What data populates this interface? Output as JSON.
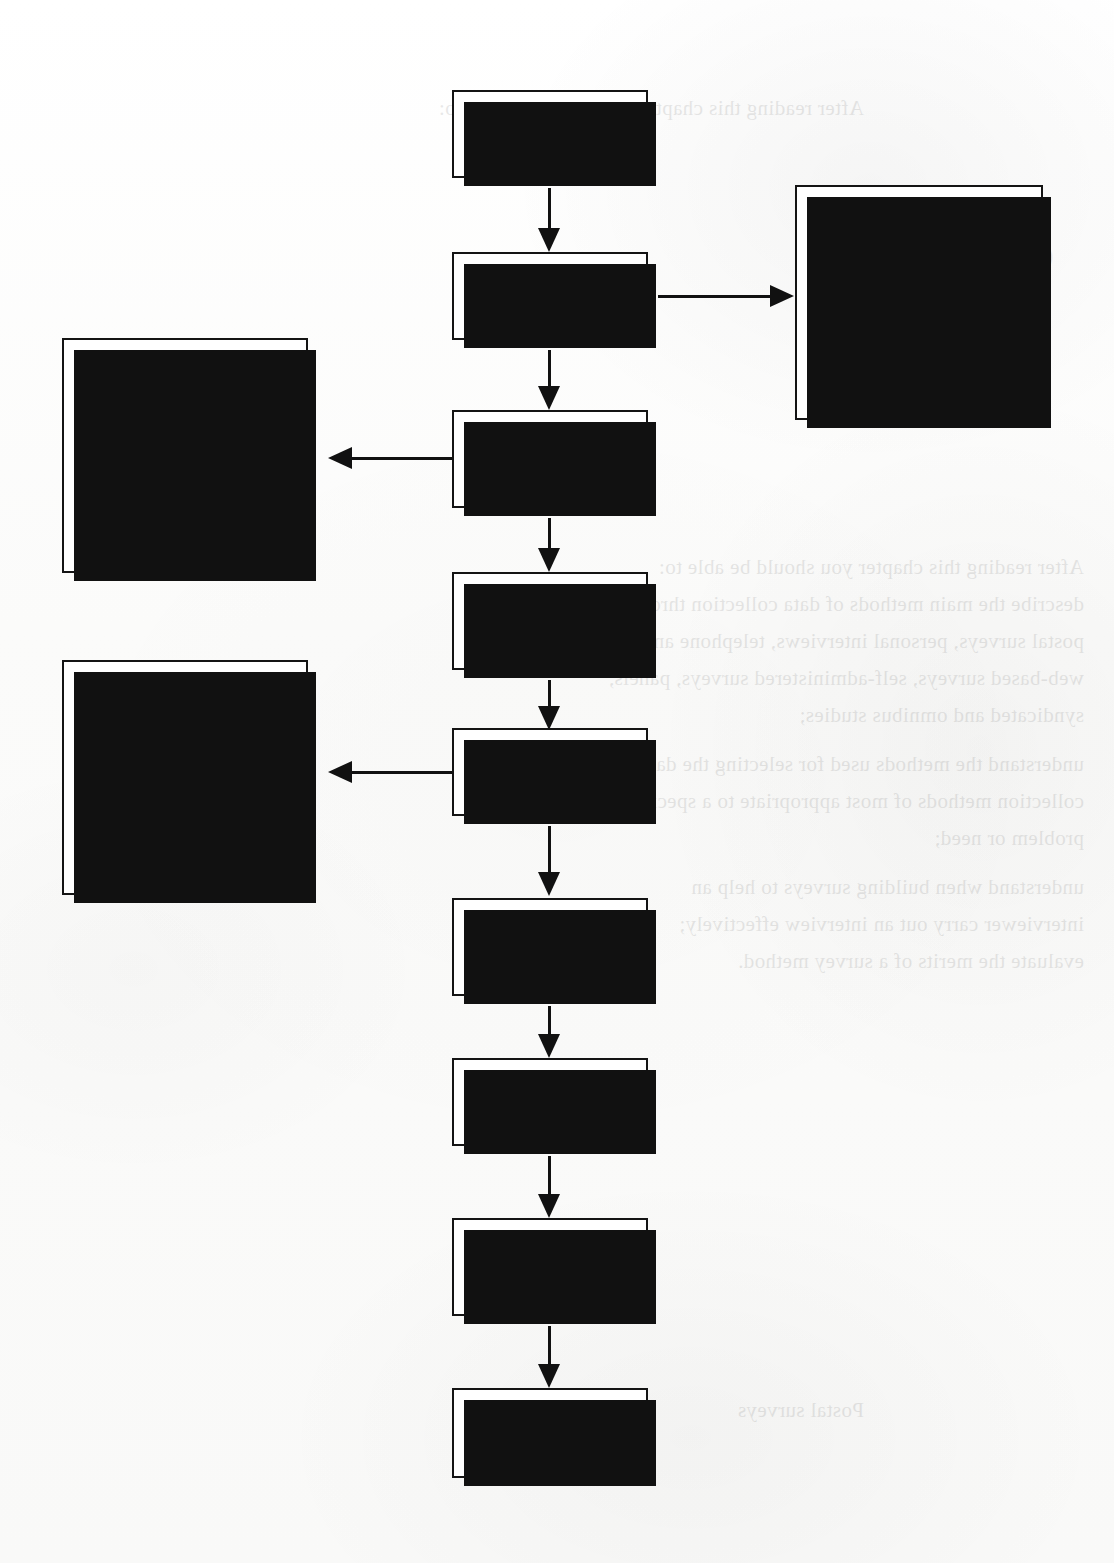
{
  "diagram": {
    "colors": {
      "box_fill": "#ffffff",
      "box_border": "#141414",
      "shadow": "#111111",
      "text": "#111111",
      "page_background": "#fdfdfd"
    },
    "main_nodes": [
      {
        "id": "introduction",
        "label": "Introduction",
        "lines": [
          "Introduction"
        ]
      },
      {
        "id": "postal-surveys",
        "label": "Postal surveys",
        "lines": [
          "Postal surveys"
        ]
      },
      {
        "id": "personal-interviews",
        "label": "Personal interviews",
        "lines": [
          "Personal",
          "interviews"
        ]
      },
      {
        "id": "self-administered",
        "label": "Self-administered surveys",
        "lines": [
          "Self-administered",
          "surveys"
        ]
      },
      {
        "id": "panels",
        "label": "Panels",
        "lines": [
          "Panels"
        ]
      },
      {
        "id": "syndicated",
        "label": "Syndicated research services",
        "lines": [
          "Syndicated",
          "research services"
        ]
      },
      {
        "id": "omnibus",
        "label": "Omnibus studies",
        "lines": [
          "Omnibus studies"
        ]
      },
      {
        "id": "interactive",
        "label": "Interactive research",
        "lines": [
          "Interactive",
          "research"
        ]
      },
      {
        "id": "summary",
        "label": "Summary",
        "lines": [
          "Summary"
        ]
      }
    ],
    "detail_nodes": [
      {
        "id": "postal-details",
        "side": "right",
        "parent": "postal-surveys",
        "topics": [
          {
            "lines": [
              "Advantages and",
              "limitations"
            ]
          },
          {
            "lines": [
              "When postal surveys",
              "are appropriate"
            ]
          },
          {
            "lines": [
              "Making postal surveys",
              "more efficient"
            ]
          }
        ]
      },
      {
        "id": "interview-details",
        "side": "left",
        "parent": "personal-interviews",
        "topics": [
          {
            "lines": [
              "Influence of the",
              "interviewer"
            ]
          },
          {
            "lines": [
              "Interviewing in",
              "shopping precincts"
            ]
          },
          {
            "lines": [
              "Cost of personal",
              "interviews"
            ]
          }
        ]
      },
      {
        "id": "panel-details",
        "side": "left",
        "parent": "panels",
        "topics": [
          {
            "lines": [
              "Major types of",
              "panel"
            ]
          },
          {
            "lines": [
              "Longitudinal",
              "analysis"
            ]
          },
          {
            "lines": [
              "Custom study",
              "panel"
            ]
          }
        ]
      }
    ],
    "connectors": [
      {
        "id": "introduction-to-postal-surveys",
        "from": "introduction",
        "to": "postal-surveys",
        "direction": "down"
      },
      {
        "id": "postal-surveys-to-postal-details",
        "from": "postal-surveys",
        "to": "postal-details",
        "direction": "right"
      },
      {
        "id": "postal-surveys-to-personal-interviews",
        "from": "postal-surveys",
        "to": "personal-interviews",
        "direction": "down"
      },
      {
        "id": "personal-interviews-to-details",
        "from": "personal-interviews",
        "to": "interview-details",
        "direction": "left"
      },
      {
        "id": "personal-interviews-to-self-admin",
        "from": "personal-interviews",
        "to": "self-administered",
        "direction": "down"
      },
      {
        "id": "self-admin-to-panels",
        "from": "self-administered",
        "to": "panels",
        "direction": "down"
      },
      {
        "id": "panels-to-panel-details",
        "from": "panels",
        "to": "panel-details",
        "direction": "left"
      },
      {
        "id": "panels-to-syndicated",
        "from": "panels",
        "to": "syndicated",
        "direction": "down"
      },
      {
        "id": "syndicated-to-omnibus",
        "from": "syndicated",
        "to": "omnibus",
        "direction": "down"
      },
      {
        "id": "omnibus-to-interactive",
        "from": "omnibus",
        "to": "interactive",
        "direction": "down"
      },
      {
        "id": "interactive-to-summary",
        "from": "interactive",
        "to": "summary",
        "direction": "down"
      }
    ]
  },
  "bleed_through": {
    "note": "faint mirrored show-through from the reverse side of the scanned page",
    "heading": "OVERVIEW",
    "lines": [
      "After reading this chapter you should be able to:",
      "describe the main methods of data collection through",
      "postal surveys, personal interviews, telephone and",
      "web-based surveys, self-administered surveys, panels,",
      "syndicated and omnibus studies;",
      "understand the methods used for selecting the data",
      "collection methods of most appropriate to a specific",
      "problem or need;",
      "understand when building surveys to help an",
      "interviewer carry out an interview effectively;",
      "evaluate the merits of a survey method."
    ],
    "margin_label": "OVERVIEW",
    "footer": "Postal surveys"
  }
}
